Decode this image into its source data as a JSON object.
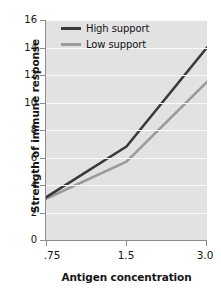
{
  "chart_data": {
    "type": "line",
    "title": "",
    "xlabel": "Antigen concentration",
    "ylabel": "Strength of immune response",
    "x": [
      0.75,
      1.5,
      3.0
    ],
    "xticklabels": [
      ".75",
      "1.5",
      "3.0"
    ],
    "yticklabels": [
      "0",
      "2",
      "4",
      "6",
      "8",
      "10",
      "12",
      "14",
      "16"
    ],
    "yticks": [
      0,
      2,
      4,
      6,
      8,
      10,
      12,
      14,
      16
    ],
    "ylim": [
      0,
      16
    ],
    "grid": "horizontal",
    "legend_position": "upper-left-inside",
    "series": [
      {
        "name": "High support",
        "values": [
          3.1,
          6.8,
          14.0
        ],
        "color": "#3a3a3a"
      },
      {
        "name": "Low support",
        "values": [
          3.0,
          5.7,
          11.5
        ],
        "color": "#9a9a9a"
      }
    ],
    "plot_background": "#e2e2e2",
    "gridline_color": "#fafafa",
    "axis_color": "#8d8d8d",
    "text_color": "#151515"
  }
}
